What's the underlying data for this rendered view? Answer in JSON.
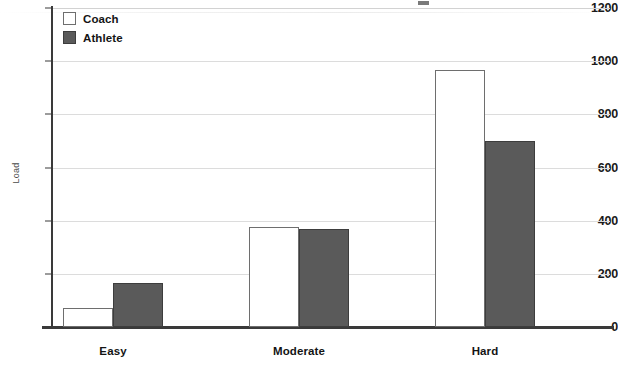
{
  "chart_data": {
    "type": "bar",
    "title": "",
    "subtitle": "",
    "xlabel": "",
    "ylabel": "Load",
    "categories": [
      "Easy",
      "Moderate",
      "Hard"
    ],
    "series": [
      {
        "name": "Coach",
        "values": [
          70,
          378,
          965
        ],
        "fill": "#ffffff",
        "stroke": "#6e6e6e"
      },
      {
        "name": "Athlete",
        "values": [
          165,
          370,
          700
        ],
        "fill": "#5a5a5a",
        "stroke": "#3d3d3d"
      }
    ],
    "ylim": [
      0,
      1200
    ],
    "yticks": [
      0,
      200,
      400,
      600,
      800,
      1000,
      1200
    ],
    "ytick_labels": [
      "0",
      "200",
      "400",
      "600",
      "800",
      "1000",
      "1200"
    ],
    "grid": true,
    "grid_axis": "y",
    "legend_position": "top-left-inside",
    "legend_entries": [
      "Coach",
      "Athlete"
    ],
    "bar_group_mode": "grouped",
    "annotations": []
  },
  "colors": {
    "coach_fill": "#ffffff",
    "coach_stroke": "#6e6e6e",
    "athlete_fill": "#5a5a5a",
    "athlete_stroke": "#3d3d3d",
    "gridline": "#dcdcdc",
    "axis": "#3a3a3a",
    "tick_text": "#1a1a1a",
    "axis_title": "#4a4a4a",
    "background": "#ffffff"
  }
}
